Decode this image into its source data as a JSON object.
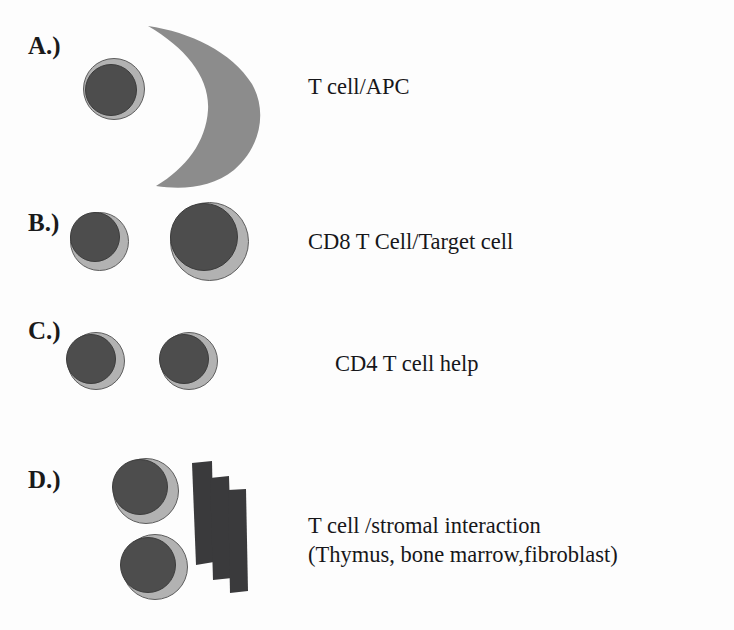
{
  "figure": {
    "width": 734,
    "height": 630,
    "background_color": "#fdfdfd"
  },
  "colors": {
    "cytoplasm": "#b2b2b2",
    "cytoplasm_outline": "#5d5d5d",
    "nucleus": "#4d4d4d",
    "nucleus_outline": "#3c3c3c",
    "apc_crescent": "#8c8c8c",
    "stromal_slab": "#3a3a3c",
    "text": "#17171a"
  },
  "panels": [
    {
      "id": "a",
      "letter": "A.)",
      "caption": "T cell/APC",
      "caption_lines": [
        "T cell/APC"
      ],
      "shapes": {
        "cells": 1,
        "apc_crescent": true
      }
    },
    {
      "id": "b",
      "letter": "B.)",
      "caption": "CD8 T Cell/Target cell",
      "caption_lines": [
        "CD8 T Cell/Target cell"
      ],
      "shapes": {
        "cells": 2,
        "apc_crescent": false
      }
    },
    {
      "id": "c",
      "letter": "C.)",
      "caption": "CD4 T cell help",
      "caption_lines": [
        "CD4 T cell help"
      ],
      "shapes": {
        "cells": 2,
        "apc_crescent": false
      }
    },
    {
      "id": "d",
      "letter": "D.)",
      "caption": "T cell /stromal interaction (Thymus, bone marrow,fibroblast)",
      "caption_lines": [
        "T cell /stromal interaction",
        "(Thymus, bone marrow,fibroblast)"
      ],
      "shapes": {
        "cells": 2,
        "stromal_slabs": 3
      }
    }
  ]
}
